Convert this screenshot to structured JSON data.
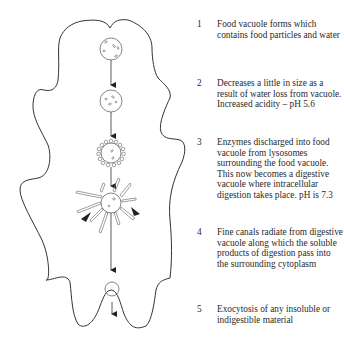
{
  "diagram": {
    "steps": [
      {
        "number": "1",
        "text": "Food vacuole forms which contains food particles and water"
      },
      {
        "number": "2",
        "text": "Decreases a little in size as a result of water loss from vacuole. Increased acidity – pH 5.6"
      },
      {
        "number": "3",
        "text": "Enzymes discharged into food vacuole from lysosomes surrounding the food vacuole. This now becomes a digestive vacuole where intracellular digestion takes place. pH is 7.3"
      },
      {
        "number": "4",
        "text": "Fine canals radiate from digestive vacuole along which the soluble products of digestion pass into the surrounding cytoplasm"
      },
      {
        "number": "5",
        "text": "Exocytosis of any insoluble or indigestible material"
      }
    ],
    "colors": {
      "outline": "#333333",
      "text": "#2a2a2a",
      "background": "#ffffff"
    }
  }
}
